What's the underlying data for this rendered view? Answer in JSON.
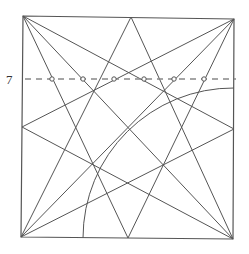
{
  "diagram": {
    "label": "7",
    "colors": {
      "line": "#555555",
      "dash": "#888888",
      "marker_fill": "#ffffff",
      "marker_stroke": "#555555"
    },
    "square": {
      "tl": [
        23,
        16
      ],
      "tr": [
        234,
        19
      ],
      "br": [
        233,
        239
      ],
      "bl": [
        21,
        237
      ]
    },
    "lines": [
      {
        "name": "diagonal-tl-br",
        "from": [
          23,
          16
        ],
        "to": [
          233,
          239
        ]
      },
      {
        "name": "diagonal-tr-bl",
        "from": [
          234,
          19
        ],
        "to": [
          21,
          237
        ]
      },
      {
        "name": "tl-to-bottom-mid",
        "from": [
          23,
          16
        ],
        "to": [
          128,
          238
        ]
      },
      {
        "name": "tr-to-bottom-mid",
        "from": [
          234,
          19
        ],
        "to": [
          128,
          238
        ]
      },
      {
        "name": "tl-to-right-mid",
        "from": [
          23,
          16
        ],
        "to": [
          234,
          129
        ]
      },
      {
        "name": "tr-to-left-mid",
        "from": [
          234,
          19
        ],
        "to": [
          22,
          127
        ]
      },
      {
        "name": "bl-to-right-mid",
        "from": [
          21,
          237
        ],
        "to": [
          234,
          129
        ]
      },
      {
        "name": "br-to-left-mid",
        "from": [
          233,
          239
        ],
        "to": [
          22,
          127
        ]
      },
      {
        "name": "top-point-to-br",
        "from": [
          131,
          17
        ],
        "to": [
          233,
          239
        ]
      },
      {
        "name": "top-point-to-bl",
        "from": [
          131,
          17
        ],
        "to": [
          21,
          237
        ]
      }
    ],
    "arc": {
      "center": [
        233,
        238
      ],
      "radius": 150,
      "from": [
        83,
        238
      ],
      "to": [
        234,
        88
      ]
    },
    "dashed_line": {
      "y": 79,
      "x1": 25,
      "x2": 236
    },
    "markers": [
      52,
      83,
      114,
      144,
      174,
      204
    ]
  }
}
